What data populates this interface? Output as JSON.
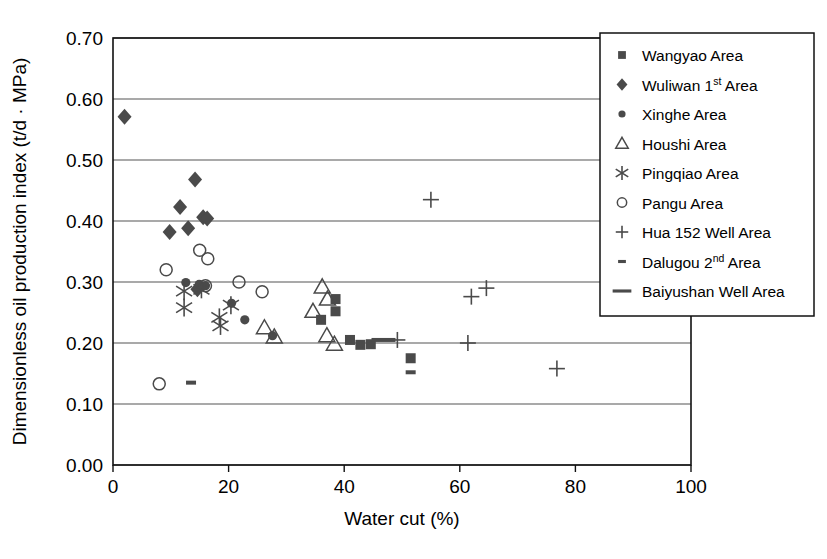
{
  "chart_data": {
    "type": "scatter",
    "title": "",
    "xlabel": "Water cut (%)",
    "ylabel": "Dimensionless oil production index (t/d · MPa)",
    "xlim": [
      0,
      100
    ],
    "ylim": [
      0.0,
      0.7
    ],
    "xticks": [
      "0",
      "20",
      "40",
      "60",
      "80",
      "100"
    ],
    "xtick_values": [
      0,
      20,
      40,
      60,
      80,
      100
    ],
    "yticks": [
      "0.00",
      "0.10",
      "0.20",
      "0.30",
      "0.40",
      "0.50",
      "0.60",
      "0.70"
    ],
    "ytick_values": [
      0.0,
      0.1,
      0.2,
      0.3,
      0.4,
      0.5,
      0.6,
      0.7
    ],
    "grid": "horizontal",
    "legend_position": "top-right",
    "marker_color": "#4a4a4a",
    "series": [
      {
        "name": "Wangyao Area",
        "marker": "square-filled",
        "points": [
          [
            38.5,
            0.272
          ],
          [
            38.5,
            0.252
          ],
          [
            36.0,
            0.238
          ],
          [
            41.0,
            0.205
          ],
          [
            42.8,
            0.197
          ],
          [
            44.6,
            0.198
          ],
          [
            51.5,
            0.175
          ]
        ]
      },
      {
        "name": "Wuliwan 1st Area",
        "marker": "diamond-filled",
        "points": [
          [
            2.0,
            0.571
          ],
          [
            9.8,
            0.382
          ],
          [
            11.6,
            0.423
          ],
          [
            14.2,
            0.468
          ],
          [
            13.0,
            0.388
          ],
          [
            15.6,
            0.406
          ],
          [
            16.3,
            0.404
          ],
          [
            14.6,
            0.288
          ]
        ]
      },
      {
        "name": "Xinghe Area",
        "marker": "circle-filled",
        "points": [
          [
            12.6,
            0.299
          ],
          [
            16.0,
            0.294
          ],
          [
            20.5,
            0.265
          ],
          [
            22.8,
            0.238
          ],
          [
            27.6,
            0.212
          ],
          [
            14.9,
            0.296
          ]
        ]
      },
      {
        "name": "Houshi Area",
        "marker": "triangle-open",
        "points": [
          [
            26.2,
            0.225
          ],
          [
            36.2,
            0.292
          ],
          [
            37.1,
            0.272
          ],
          [
            34.6,
            0.252
          ],
          [
            37.0,
            0.212
          ],
          [
            38.3,
            0.198
          ],
          [
            27.9,
            0.21
          ]
        ]
      },
      {
        "name": "Pingqiao Area",
        "marker": "asterisk",
        "points": [
          [
            12.3,
            0.285
          ],
          [
            12.3,
            0.258
          ],
          [
            15.3,
            0.288
          ],
          [
            18.4,
            0.242
          ],
          [
            18.6,
            0.228
          ],
          [
            20.4,
            0.262
          ]
        ]
      },
      {
        "name": "Pangu Area",
        "marker": "circle-open",
        "points": [
          [
            9.2,
            0.32
          ],
          [
            15.0,
            0.352
          ],
          [
            16.4,
            0.338
          ],
          [
            16.0,
            0.294
          ],
          [
            21.8,
            0.3
          ],
          [
            25.8,
            0.284
          ],
          [
            8.0,
            0.133
          ]
        ]
      },
      {
        "name": "Hua 152 Well Area",
        "marker": "plus",
        "points": [
          [
            55.0,
            0.435
          ],
          [
            62.0,
            0.276
          ],
          [
            64.6,
            0.29
          ],
          [
            61.4,
            0.2
          ],
          [
            76.8,
            0.158
          ],
          [
            49.2,
            0.205
          ]
        ]
      },
      {
        "name": "Dalugou 2nd Area",
        "marker": "dash-short",
        "points": [
          [
            13.5,
            0.135
          ],
          [
            51.5,
            0.152
          ]
        ]
      },
      {
        "name": "Baiyushan Well Area",
        "marker": "dash-long",
        "points": [
          [
            46.8,
            0.205
          ]
        ]
      }
    ]
  },
  "legend": {
    "items": [
      {
        "label": "Wangyao Area",
        "marker": "square-filled",
        "sup": "",
        "pre": "Wangyao Area",
        "post": ""
      },
      {
        "label": "Wuliwan 1st Area",
        "marker": "diamond-filled",
        "sup": "st",
        "pre": "Wuliwan 1",
        "post": " Area"
      },
      {
        "label": "Xinghe Area",
        "marker": "circle-filled",
        "sup": "",
        "pre": "Xinghe Area",
        "post": ""
      },
      {
        "label": "Houshi Area",
        "marker": "triangle-open",
        "sup": "",
        "pre": "Houshi Area",
        "post": ""
      },
      {
        "label": "Pingqiao Area",
        "marker": "asterisk",
        "sup": "",
        "pre": "Pingqiao Area",
        "post": ""
      },
      {
        "label": "Pangu Area",
        "marker": "circle-open",
        "sup": "",
        "pre": "Pangu Area",
        "post": ""
      },
      {
        "label": "Hua 152 Well Area",
        "marker": "plus",
        "sup": "",
        "pre": "Hua 152 Well Area",
        "post": ""
      },
      {
        "label": "Dalugou 2nd Area",
        "marker": "dash-short",
        "sup": "nd",
        "pre": "Dalugou 2",
        "post": " Area"
      },
      {
        "label": "Baiyushan Well Area",
        "marker": "dash-long",
        "sup": "",
        "pre": "Baiyushan Well Area",
        "post": ""
      }
    ]
  }
}
